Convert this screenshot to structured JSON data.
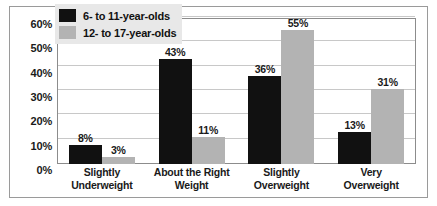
{
  "chart_data": {
    "type": "bar",
    "title": "",
    "xlabel": "",
    "ylabel": "",
    "ylim": [
      0,
      60
    ],
    "grid": true,
    "legend_position": "top-left",
    "categories": [
      "Slightly Underweight",
      "About the Right Weight",
      "Slightly Overweight",
      "Very Overweight"
    ],
    "category_lines": [
      [
        "Slightly",
        "Underweight"
      ],
      [
        "About the Right",
        "Weight"
      ],
      [
        "Slightly",
        "Overweight"
      ],
      [
        "Very",
        "Overweight"
      ]
    ],
    "yticks": [
      0,
      10,
      20,
      30,
      40,
      50,
      60
    ],
    "ytick_labels": [
      "0%",
      "10%",
      "20%",
      "30%",
      "40%",
      "50%",
      "60%"
    ],
    "series": [
      {
        "name": "6- to 11-year-olds",
        "color": "#111111",
        "values": [
          8,
          43,
          36,
          13
        ],
        "value_labels": [
          "8%",
          "43%",
          "36%",
          "13%"
        ]
      },
      {
        "name": "12- to 17-year-olds",
        "color": "#b3b3b3",
        "values": [
          3,
          11,
          55,
          31
        ],
        "value_labels": [
          "3%",
          "11%",
          "55%",
          "31%"
        ]
      }
    ]
  },
  "legend": {
    "items": [
      {
        "label": "6- to 11-year-olds",
        "swatch": "dark"
      },
      {
        "label": "12- to 17-year-olds",
        "swatch": "light"
      }
    ]
  }
}
